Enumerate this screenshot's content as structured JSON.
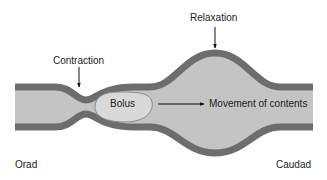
{
  "diagram": {
    "labels": {
      "contraction": "Contraction",
      "relaxation": "Relaxation",
      "bolus": "Bolus",
      "movement": "Movement of contents",
      "orad": "Orad",
      "caudad": "Caudad"
    },
    "colors": {
      "wall": "#6d6d6d",
      "lumen": "#c4c4c4",
      "bolus_fill": "#d9d9d9",
      "bolus_stroke": "#8a8a8a",
      "text": "#222222",
      "background": "#ffffff"
    }
  }
}
